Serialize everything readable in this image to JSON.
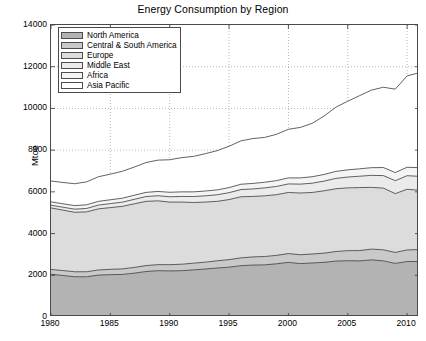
{
  "chart_data": {
    "type": "area",
    "stacked": true,
    "title": "Energy Consumption by Region",
    "xlabel": "",
    "ylabel": "Mtoe",
    "xlim": [
      1980,
      2011
    ],
    "ylim": [
      0,
      14000
    ],
    "xticks": [
      1980,
      1985,
      1990,
      1995,
      2000,
      2005,
      2010
    ],
    "yticks": [
      0,
      2000,
      4000,
      6000,
      8000,
      10000,
      12000,
      14000
    ],
    "grid": true,
    "grid_style": "dotted",
    "legend_position": "upper left",
    "x": [
      1980,
      1981,
      1982,
      1983,
      1984,
      1985,
      1986,
      1987,
      1988,
      1989,
      1990,
      1991,
      1992,
      1993,
      1994,
      1995,
      1996,
      1997,
      1998,
      1999,
      2000,
      2001,
      2002,
      2003,
      2004,
      2005,
      2006,
      2007,
      2008,
      2009,
      2010,
      2011
    ],
    "series": [
      {
        "name": "North America",
        "color": "#b3b3b3",
        "values": [
          2050,
          1990,
          1930,
          1930,
          2010,
          2030,
          2040,
          2100,
          2180,
          2220,
          2210,
          2220,
          2260,
          2300,
          2350,
          2390,
          2460,
          2490,
          2500,
          2550,
          2620,
          2560,
          2590,
          2620,
          2680,
          2700,
          2690,
          2740,
          2690,
          2570,
          2660,
          2660
        ]
      },
      {
        "name": "Central & South America",
        "color": "#c9c9c9",
        "values": [
          230,
          235,
          240,
          240,
          245,
          255,
          265,
          275,
          285,
          290,
          300,
          310,
          320,
          330,
          345,
          360,
          375,
          390,
          400,
          405,
          420,
          425,
          430,
          440,
          460,
          480,
          495,
          515,
          530,
          525,
          555,
          575
        ]
      },
      {
        "name": "Europe",
        "color": "#dcdcdc",
        "values": [
          2950,
          2900,
          2850,
          2870,
          2930,
          2960,
          3000,
          3050,
          3080,
          3060,
          3000,
          2980,
          2910,
          2880,
          2850,
          2880,
          2930,
          2900,
          2910,
          2910,
          2930,
          2960,
          2950,
          2990,
          3010,
          3010,
          3020,
          2960,
          2960,
          2820,
          2910,
          2840
        ]
      },
      {
        "name": "Middle East",
        "color": "#ebebeb",
        "values": [
          130,
          140,
          150,
          165,
          180,
          190,
          200,
          215,
          230,
          245,
          255,
          270,
          285,
          300,
          315,
          330,
          345,
          360,
          380,
          395,
          410,
          425,
          445,
          465,
          495,
          520,
          545,
          575,
          600,
          620,
          650,
          670
        ]
      },
      {
        "name": "Africa",
        "color": "#f4f4f4",
        "values": [
          160,
          165,
          170,
          175,
          180,
          185,
          190,
          195,
          200,
          205,
          215,
          220,
          225,
          230,
          235,
          245,
          255,
          265,
          270,
          280,
          290,
          300,
          310,
          320,
          335,
          345,
          355,
          370,
          385,
          390,
          405,
          415
        ]
      },
      {
        "name": "Asia Pacific",
        "color": "#ffffff",
        "values": [
          1000,
          1020,
          1050,
          1100,
          1180,
          1230,
          1290,
          1350,
          1430,
          1500,
          1560,
          1640,
          1700,
          1790,
          1880,
          1980,
          2080,
          2150,
          2150,
          2220,
          2330,
          2420,
          2560,
          2800,
          3080,
          3290,
          3510,
          3720,
          3850,
          4000,
          4380,
          4550
        ]
      }
    ],
    "totals": [
      6520,
      6450,
      6390,
      6480,
      6725,
      6850,
      6985,
      7185,
      7405,
      7520,
      7540,
      7640,
      7700,
      7830,
      7975,
      8185,
      8445,
      8555,
      8610,
      8760,
      9000,
      9090,
      9285,
      9635,
      10060,
      10345,
      10615,
      10880,
      11015,
      10925,
      11560,
      11710
    ]
  },
  "legend": {
    "items": [
      {
        "label": "North America"
      },
      {
        "label": "Central & South America"
      },
      {
        "label": "Europe"
      },
      {
        "label": "Middle East"
      },
      {
        "label": "Africa"
      },
      {
        "label": "Asia Pacific"
      }
    ]
  },
  "axes": {
    "ylabel": "Mtoe",
    "yticklabels": [
      "14000",
      "12000",
      "10000",
      "8000",
      "6000",
      "4000",
      "2000",
      "0"
    ],
    "xticklabels": [
      "1980",
      "1985",
      "1990",
      "1995",
      "2000",
      "2005",
      "2010"
    ]
  }
}
